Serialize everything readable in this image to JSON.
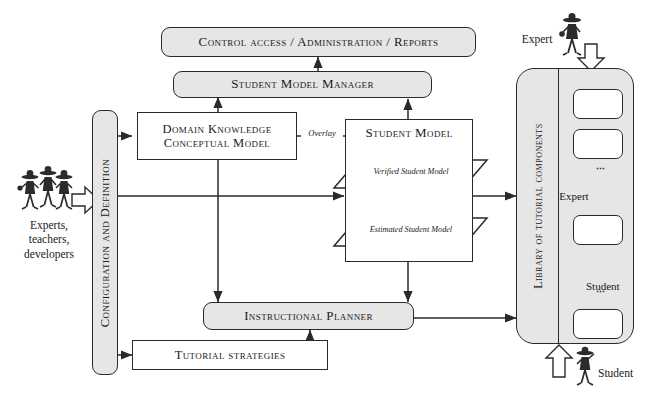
{
  "diagram": {
    "colors": {
      "shaded_fill": "#e6e6e6",
      "white_fill": "#ffffff",
      "stroke": "#2a2a2a"
    },
    "nodes": {
      "control_access": "Control access / Administration / Reports",
      "student_model_manager": "Student Model Manager",
      "domain_knowledge": "Domain Knowledge Conceptual Model",
      "domain_knowledge_line1": "Domain Knowledge",
      "domain_knowledge_line2": "Conceptual Model",
      "student_model": "Student Model",
      "verified_student_model": "Verified Student Model",
      "estimated_student_model": "Estimated Student Model",
      "instructional_planner": "Instructional Planner",
      "tutorial_strategies": "Tutorial strategies",
      "configuration_and_definition": "Configuration and Definition",
      "library_of_tutorial_components": "Library of tutorial components"
    },
    "edge_labels": {
      "overlay": "Overlay"
    },
    "actors": {
      "experts_teachers_developers_line1": "Experts,",
      "experts_teachers_developers_line2": "teachers,",
      "experts_teachers_developers_line3": "developers",
      "expert_top": "Expert",
      "expert_inner": "Expert",
      "student_inner": "Student",
      "student_bottom": "Student"
    },
    "ellipsis": "⋮"
  }
}
